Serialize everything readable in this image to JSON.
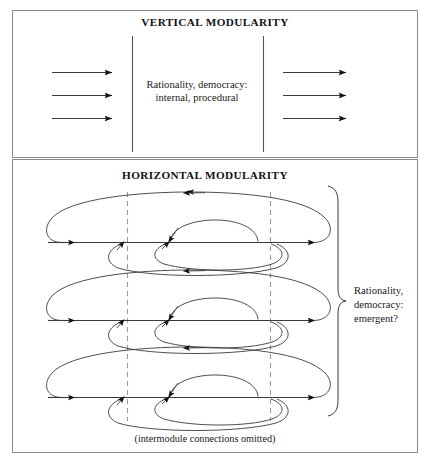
{
  "figure": {
    "width": 430,
    "height": 463,
    "background": "#ffffff",
    "frame_color": "#8a8a8a",
    "ink_color": "#3a3a3a",
    "dashed_color": "#9a9a9a"
  },
  "panels": {
    "top": {
      "title": "VERTICAL MODULARITY",
      "center_label_line1": "Rationality, democracy:",
      "center_label_line2": "internal, procedural",
      "left_arrow_count": 3,
      "right_arrow_count": 3,
      "column_divider_count": 2
    },
    "bottom": {
      "title": "HORIZONTAL MODULARITY",
      "module_count": 3,
      "dashed_boundary_count": 2,
      "side_label_line1": "Rationality,",
      "side_label_line2": "democracy:",
      "side_label_line3": "emergent?",
      "caption": "(intermodule connections omitted)",
      "brace_name": "right-curly-brace"
    }
  },
  "geometry": {
    "top_panel": {
      "x": 12,
      "y": 10,
      "w": 406,
      "h": 148,
      "title_y": 26,
      "vline_x": [
        132,
        263
      ],
      "vline_y1": 36,
      "vline_y2": 152,
      "left_arrows": {
        "x1": 52,
        "x2": 113,
        "ys": [
          72,
          95,
          118
        ]
      },
      "right_arrows": {
        "x1": 283,
        "x2": 347,
        "ys": [
          72,
          95,
          118
        ]
      },
      "center_text_x": 197,
      "center_text_y": 92
    },
    "bottom_panel": {
      "x": 12,
      "y": 159,
      "w": 406,
      "h": 294,
      "title_y": 178,
      "dashed_x": [
        127,
        270
      ],
      "dashed_y1": 192,
      "dashed_y2": 420,
      "module_axis_y": [
        242,
        320,
        397
      ],
      "axis_x1": 48,
      "axis_x2": 315,
      "brace": {
        "x": 330,
        "y_top": 186,
        "y_bottom": 416,
        "mid": 301
      },
      "side_text_x": 354,
      "side_text_y": 296,
      "caption_x": 205,
      "caption_y": 440
    }
  }
}
